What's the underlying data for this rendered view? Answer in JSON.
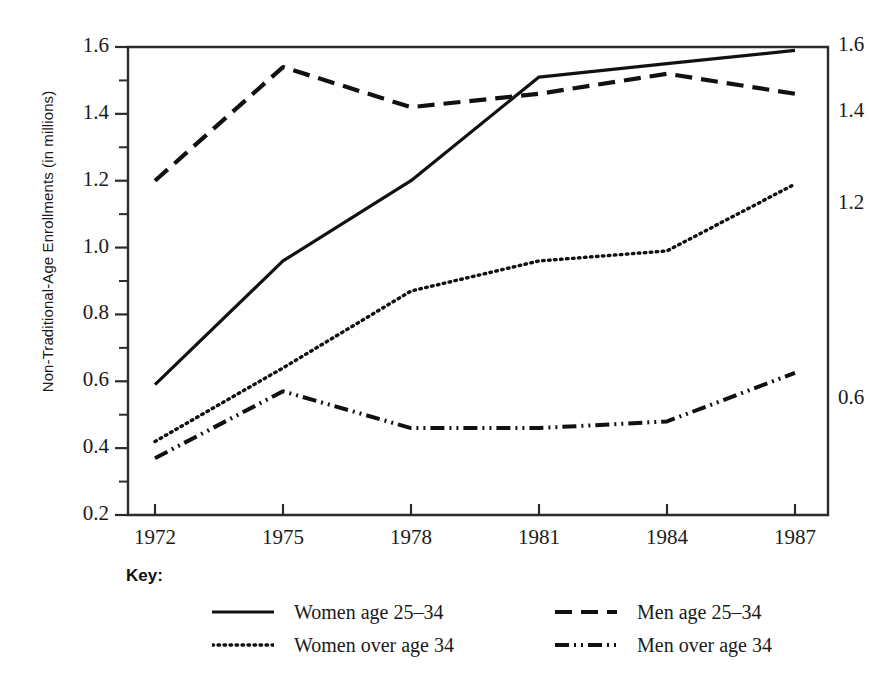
{
  "chart_data": {
    "type": "line",
    "title": "",
    "xlabel": "",
    "ylabel": "Non-Traditional-Age Enrollments (in millions)",
    "categories": [
      "1972",
      "1975",
      "1978",
      "1981",
      "1984",
      "1987"
    ],
    "x": [
      1972,
      1975,
      1978,
      1981,
      1984,
      1987
    ],
    "xlim": [
      1972,
      1987
    ],
    "ylim": [
      0.2,
      1.6
    ],
    "grid": false,
    "legend_position": "bottom",
    "y_ticks_major": [
      "0.2",
      "0.4",
      "0.6",
      "0.8",
      "1.0",
      "1.2",
      "1.4",
      "1.6"
    ],
    "y_tick_values": [
      0.2,
      0.4,
      0.6,
      0.8,
      1.0,
      1.2,
      1.4,
      1.6
    ],
    "y_minor_tick_values": [
      0.3,
      0.5,
      0.7,
      0.9,
      1.1,
      1.3,
      1.5
    ],
    "series": [
      {
        "name": "Women age 25–34",
        "style": "solid",
        "values": [
          0.59,
          0.96,
          1.2,
          1.51,
          1.55,
          1.59
        ],
        "end_label": "1.6"
      },
      {
        "name": "Men age 25–34",
        "style": "dashed",
        "values": [
          1.2,
          1.54,
          1.42,
          1.46,
          1.52,
          1.46
        ],
        "end_label": "1.4"
      },
      {
        "name": "Women over age 34",
        "style": "dotted",
        "values": [
          0.42,
          0.64,
          0.87,
          0.96,
          0.99,
          1.19
        ],
        "end_label": "1.2"
      },
      {
        "name": "Men over age 34",
        "style": "dash-dot",
        "values": [
          0.37,
          0.57,
          0.46,
          0.46,
          0.48,
          0.625
        ],
        "end_label": "0.6"
      }
    ],
    "line_color": "#111111"
  },
  "axis": {
    "y_labels": [
      "1.6",
      "1.4",
      "1.2",
      "1.0",
      "0.8",
      "0.6",
      "0.4",
      "0.2"
    ],
    "x_labels": [
      "1972",
      "1975",
      "1978",
      "1981",
      "1984",
      "1987"
    ],
    "y_title": "Non-Traditional-Age Enrollments (in millions)"
  },
  "end_labels": [
    {
      "text": "1.6"
    },
    {
      "text": "1.4"
    },
    {
      "text": "1.2"
    },
    {
      "text": "0.6"
    }
  ],
  "legend": {
    "title": "Key:",
    "items": [
      {
        "label": "Women age 25–34",
        "style": "solid"
      },
      {
        "label": "Men age 25–34",
        "style": "dashed"
      },
      {
        "label": "Women over age 34",
        "style": "dotted"
      },
      {
        "label": "Men over age 34",
        "style": "dash-dot"
      }
    ]
  }
}
